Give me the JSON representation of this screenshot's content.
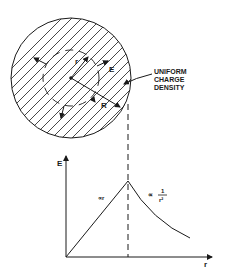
{
  "figure": {
    "sphere": {
      "label_lines": [
        "UNIFORM",
        "CHARGE",
        "DENSITY"
      ],
      "radius_label": "R",
      "inner_radius_label": "r",
      "field_label": "E"
    },
    "graph": {
      "y_axis_label": "E",
      "x_axis_label": "r",
      "inside_annotation": "∝r",
      "outside_annotation_prefix": "∝",
      "outside_annotation_num": "1",
      "outside_annotation_den": "r²"
    }
  },
  "colors": {
    "ink": "#1a1a1a",
    "background": "#ffffff"
  }
}
